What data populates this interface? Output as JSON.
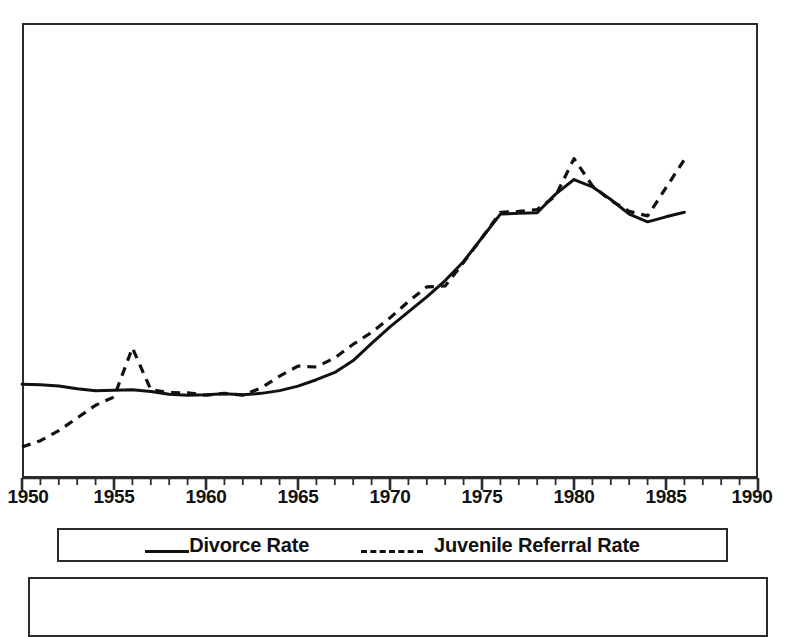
{
  "chart_data": {
    "type": "line",
    "title": "",
    "xlabel": "",
    "ylabel": "",
    "xlim": [
      1950,
      1990
    ],
    "ylim": [
      0,
      100
    ],
    "grid": false,
    "legend_position": "below-plot",
    "x_tick_labels": [
      "1950",
      "1955",
      "1960",
      "1965",
      "1970",
      "1975",
      "1980",
      "1985",
      "1990"
    ],
    "x_major_ticks": [
      1950,
      1955,
      1960,
      1965,
      1970,
      1975,
      1980,
      1985,
      1990
    ],
    "x_minor_tick_interval": 1,
    "y_tick_labels": [],
    "series": [
      {
        "name": "Divorce Rate",
        "style": "solid",
        "color": "#111111",
        "x": [
          1950,
          1951,
          1952,
          1953,
          1954,
          1955,
          1956,
          1957,
          1958,
          1959,
          1960,
          1961,
          1962,
          1963,
          1964,
          1965,
          1966,
          1967,
          1968,
          1969,
          1970,
          1971,
          1972,
          1973,
          1974,
          1975,
          1976,
          1977,
          1978,
          1979,
          1980,
          1981,
          1982,
          1983,
          1984,
          1985,
          1986
        ],
        "values": [
          20.6,
          20.5,
          20.2,
          19.6,
          19.2,
          19.3,
          19.4,
          19.0,
          18.4,
          18.2,
          18.3,
          18.5,
          18.3,
          18.6,
          19.2,
          20.2,
          21.6,
          23.2,
          25.8,
          29.6,
          33.2,
          36.5,
          39.8,
          43.4,
          47.6,
          52.8,
          58.0,
          58.2,
          58.3,
          62.4,
          65.6,
          64.0,
          61.2,
          58.0,
          56.3,
          57.4,
          58.4
        ]
      },
      {
        "name": "Juvenile Referral Rate",
        "style": "dashed",
        "color": "#111111",
        "x": [
          1950,
          1951,
          1952,
          1953,
          1954,
          1955,
          1956,
          1957,
          1958,
          1959,
          1960,
          1961,
          1962,
          1963,
          1964,
          1965,
          1966,
          1967,
          1968,
          1969,
          1970,
          1971,
          1972,
          1973,
          1974,
          1975,
          1976,
          1977,
          1978,
          1979,
          1980,
          1981,
          1982,
          1983,
          1984,
          1985,
          1986
        ],
        "values": [
          6.8,
          8.2,
          10.4,
          13.2,
          16.0,
          17.8,
          28.6,
          19.4,
          18.8,
          18.7,
          18.2,
          18.6,
          18.2,
          19.8,
          22.4,
          24.6,
          24.4,
          26.4,
          29.4,
          32.0,
          35.2,
          38.8,
          42.0,
          42.2,
          47.4,
          52.8,
          58.4,
          58.6,
          59.0,
          62.0,
          70.2,
          64.2,
          61.0,
          58.6,
          57.6,
          63.8,
          70.0
        ]
      }
    ]
  },
  "legend": {
    "entries": [
      {
        "label": "Divorce Rate",
        "style": "solid"
      },
      {
        "label": "Juvenile Referral Rate",
        "style": "dashed"
      }
    ]
  }
}
